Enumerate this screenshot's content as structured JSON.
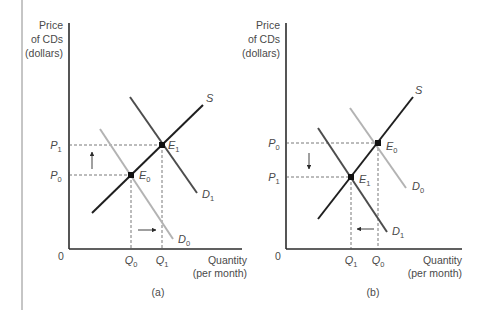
{
  "colors": {
    "axis": "#2b2b2b",
    "supply": "#1f1f1f",
    "demand_new": "#4d4d4d",
    "demand_old": "#b3b3b3",
    "dashed": "#555555",
    "border": "#8c8c8c"
  },
  "panels": [
    {
      "id": "a",
      "caption": "(a)",
      "y_axis_label": [
        "Price",
        "of CDs",
        "(dollars)"
      ],
      "x_axis_label": [
        "Quantity",
        "(per month)"
      ],
      "origin_label": "0",
      "price_labels": [
        {
          "main": "P",
          "sub": "1"
        },
        {
          "main": "P",
          "sub": "0"
        }
      ],
      "quantity_labels": [
        {
          "main": "Q",
          "sub": "0"
        },
        {
          "main": "Q",
          "sub": "1"
        }
      ],
      "curves": {
        "supply": {
          "main": "S",
          "sub": ""
        },
        "demand_dark": {
          "main": "D",
          "sub": "1"
        },
        "demand_light": {
          "main": "D",
          "sub": "0"
        }
      },
      "equilibria": [
        {
          "main": "E",
          "sub": "1"
        },
        {
          "main": "E",
          "sub": "0"
        }
      ],
      "arrows": {
        "price": "up",
        "demand_shift": "right"
      }
    },
    {
      "id": "b",
      "caption": "(b)",
      "y_axis_label": [
        "Price",
        "of CDs",
        "(dollars)"
      ],
      "x_axis_label": [
        "Quantity",
        "(per month)"
      ],
      "origin_label": "0",
      "price_labels": [
        {
          "main": "P",
          "sub": "0"
        },
        {
          "main": "P",
          "sub": "1"
        }
      ],
      "quantity_labels": [
        {
          "main": "Q",
          "sub": "1"
        },
        {
          "main": "Q",
          "sub": "0"
        }
      ],
      "curves": {
        "supply": {
          "main": "S",
          "sub": ""
        },
        "demand_light": {
          "main": "D",
          "sub": "0"
        },
        "demand_dark": {
          "main": "D",
          "sub": "1"
        }
      },
      "equilibria": [
        {
          "main": "E",
          "sub": "0"
        },
        {
          "main": "E",
          "sub": "1"
        }
      ],
      "arrows": {
        "price": "down",
        "demand_shift": "left"
      }
    }
  ]
}
